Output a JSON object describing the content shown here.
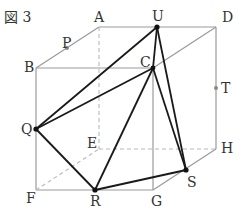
{
  "figure": {
    "title": "図 3",
    "labels": {
      "A": "A",
      "B": "B",
      "C": "C",
      "D": "D",
      "E": "E",
      "F": "F",
      "G": "G",
      "H": "H",
      "P": "P",
      "Q": "Q",
      "R": "R",
      "S": "S",
      "T": "T",
      "U": "U"
    },
    "points": {
      "A": [
        99,
        27
      ],
      "D": [
        216,
        27
      ],
      "B": [
        36,
        68
      ],
      "C": [
        153,
        68
      ],
      "E": [
        99,
        149
      ],
      "H": [
        216,
        149
      ],
      "F": [
        36,
        190
      ],
      "G": [
        153,
        190
      ],
      "U": [
        157,
        27
      ],
      "P": [
        67,
        48
      ],
      "T": [
        216,
        88
      ],
      "Q": [
        36,
        129
      ],
      "R": [
        95,
        190
      ],
      "S": [
        186,
        170
      ]
    },
    "colors": {
      "cube_edges": "#9a9a9a",
      "hidden_edges": "#b8b8b8",
      "solid_segments": "#1a1a1a"
    }
  }
}
